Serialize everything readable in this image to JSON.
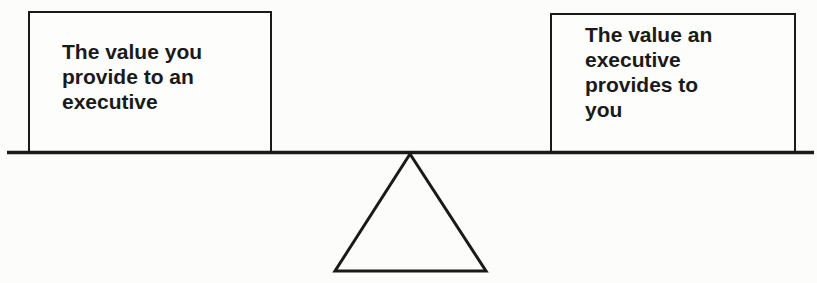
{
  "diagram": {
    "type": "balance-scale",
    "left_box": {
      "lines": [
        "The value you",
        "provide to an",
        "executive"
      ]
    },
    "right_box": {
      "lines": [
        "The value an",
        "executive",
        "provides to",
        "you"
      ]
    },
    "colors": {
      "stroke": "#1a1a1a",
      "background": "#fcfcfa"
    }
  }
}
